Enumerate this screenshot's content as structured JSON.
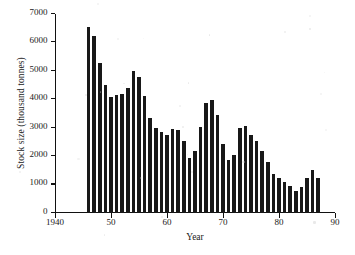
{
  "chart_data": {
    "type": "bar",
    "title": "",
    "xlabel": "Year",
    "ylabel": "Stock size (thousand tonnes)",
    "xlim": [
      1940,
      1990
    ],
    "ylim": [
      0,
      7000
    ],
    "grid": false,
    "legend": null,
    "bar_color": "#181818",
    "x_tick_labels": [
      "1940",
      "50",
      "60",
      "70",
      "80",
      "90"
    ],
    "x_tick_values": [
      1940,
      1950,
      1960,
      1970,
      1980,
      1990
    ],
    "y_tick_labels": [
      "0",
      "1000",
      "2000",
      "3000",
      "4000",
      "5000",
      "6000",
      "7000"
    ],
    "y_tick_values": [
      0,
      1000,
      2000,
      3000,
      4000,
      5000,
      6000,
      7000
    ],
    "categories": [
      1946,
      1947,
      1948,
      1949,
      1950,
      1951,
      1952,
      1953,
      1954,
      1955,
      1956,
      1957,
      1958,
      1959,
      1960,
      1961,
      1962,
      1963,
      1964,
      1965,
      1966,
      1967,
      1968,
      1969,
      1970,
      1971,
      1972,
      1973,
      1974,
      1975,
      1976,
      1977,
      1978,
      1979,
      1980,
      1981,
      1982,
      1983,
      1984,
      1985,
      1986,
      1987
    ],
    "values": [
      6550,
      6220,
      5260,
      4510,
      4080,
      4150,
      4200,
      4400,
      4980,
      4780,
      4130,
      3330,
      2990,
      2860,
      2760,
      2940,
      2910,
      2520,
      1930,
      2190,
      3030,
      3860,
      3960,
      3440,
      2440,
      1870,
      2050,
      2980,
      3050,
      2760,
      2530,
      2180,
      1790,
      1360,
      1220,
      1090,
      960,
      780,
      920,
      1220,
      1500,
      1220
    ]
  },
  "figure": {
    "axis_color": "#111111",
    "background": "#ffffff"
  }
}
